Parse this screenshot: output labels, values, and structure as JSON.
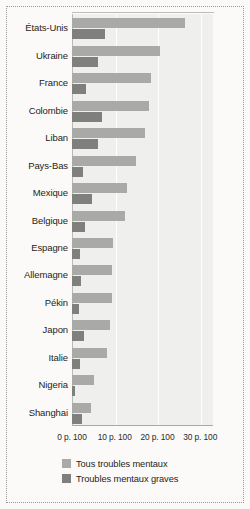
{
  "chart_data": {
    "type": "bar",
    "orientation": "horizontal",
    "title": "",
    "xlabel": "",
    "ylabel": "",
    "xlim": [
      0,
      33
    ],
    "grid": true,
    "gridlines_at": [
      10,
      20,
      30
    ],
    "legend_position": "bottom",
    "xticks": [
      {
        "value": 0,
        "label": "0 p. 100"
      },
      {
        "value": 10,
        "label": "10 p. 100"
      },
      {
        "value": 20,
        "label": "20 p. 100"
      },
      {
        "value": 30,
        "label": "30 p. 100"
      }
    ],
    "categories": [
      "États-Unis",
      "Ukraine",
      "France",
      "Colombie",
      "Liban",
      "Pays-Bas",
      "Mexique",
      "Belgique",
      "Espagne",
      "Allemagne",
      "Pékin",
      "Japon",
      "Italie",
      "Nigeria",
      "Shanghai"
    ],
    "series": [
      {
        "name": "Tous troubles mentaux",
        "color": "#a9a9a7",
        "values": [
          26.4,
          20.5,
          18.5,
          18.0,
          17.0,
          15.0,
          12.8,
          12.3,
          9.7,
          9.4,
          9.4,
          9.0,
          8.3,
          5.1,
          4.5
        ]
      },
      {
        "name": "Troubles mentaux graves",
        "color": "#7f7f7d",
        "values": [
          7.7,
          6.1,
          3.2,
          7.0,
          6.1,
          2.6,
          4.6,
          3.1,
          1.8,
          2.1,
          1.6,
          2.8,
          1.8,
          0.8,
          2.3
        ]
      }
    ]
  },
  "legend": {
    "items": [
      {
        "label": "Tous troubles mentaux",
        "color": "#a9a9a7"
      },
      {
        "label": "Troubles mentaux graves",
        "color": "#7f7f7d"
      }
    ]
  }
}
